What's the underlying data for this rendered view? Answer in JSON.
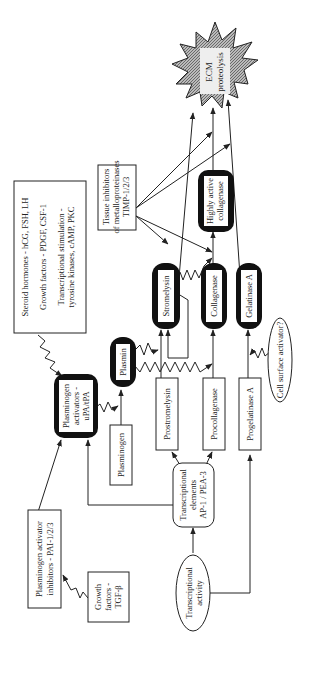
{
  "diagram": {
    "orientation": "rotated-90-ccw",
    "nodes": {
      "ecm": {
        "line1": "ECM",
        "line2": "proteolysis"
      },
      "highly_active_collagenase": {
        "line1": "Highly active",
        "line2": "collagenase"
      },
      "timp": {
        "line1": "Tissue inhibitors",
        "line2": "of metalloproteinases",
        "line3": "TIMP-1/2/3"
      },
      "stimuli": {
        "line1": "Steroid hormones - hCG, FSH, LH",
        "line2": "Growth factors - PDGF, CSF-1",
        "line3": "Transcriptional stimulation -",
        "line4": "tyrosine kinases, cAMP, PKC"
      },
      "stromelysin": {
        "label": "Stromelysin"
      },
      "collagenase": {
        "label": "Collagenase"
      },
      "gelatinase_a": {
        "label": "Gelatinase A"
      },
      "plasmin": {
        "label": "Plasmin"
      },
      "plasminogen_activators": {
        "line1": "Plasminogen",
        "line2": "activators -",
        "line3": "uPA/tPA"
      },
      "plasminogen": {
        "label": "Plasminogen"
      },
      "prostromelysin": {
        "label": "Prostromelysin"
      },
      "procollagenase": {
        "label": "Procollagenase"
      },
      "progelatinase_a": {
        "label": "Progelatinase A"
      },
      "cell_surface_activator": {
        "label": "Cell surface activator?"
      },
      "transcriptional_elements": {
        "line1": "Transcriptional",
        "line2": "elements",
        "line3": "AP-1 / PEA-3"
      },
      "transcriptional_activity": {
        "line1": "Transcriptional",
        "line2": "activity"
      },
      "pai": {
        "line1": "Plasminogen activator",
        "line2": "inhibitors - PAI-1/2/3"
      },
      "tgf": {
        "line1": "Growth",
        "line2": "factors -",
        "line3": "TGF-β"
      }
    },
    "colors": {
      "line": "#222222",
      "fill_dark": "#111111",
      "starburst": "#9a9a9a"
    }
  }
}
